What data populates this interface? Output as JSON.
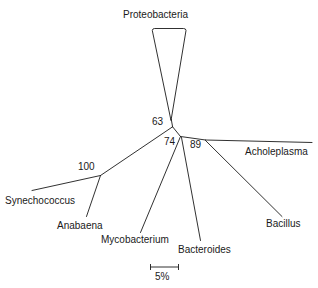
{
  "figure": {
    "type": "unrooted-phylogenetic-tree",
    "background_color": "#ffffff",
    "line_color": "#1a1a1a"
  },
  "taxa": [
    {
      "name": "Proteobacteria",
      "label": "Proteobacteria",
      "collapsed_clade": true
    },
    {
      "name": "Synechococcus",
      "label": "Synechococcus",
      "collapsed_clade": false
    },
    {
      "name": "Anabaena",
      "label": "Anabaena",
      "collapsed_clade": false
    },
    {
      "name": "Mycobacterium",
      "label": "Mycobacterium",
      "collapsed_clade": false
    },
    {
      "name": "Bacteroides",
      "label": "Bacteroides",
      "collapsed_clade": false
    },
    {
      "name": "Acholeplasma",
      "label": "Acholeplasma",
      "collapsed_clade": false
    },
    {
      "name": "Bacillus",
      "label": "Bacillus",
      "collapsed_clade": false
    }
  ],
  "support_values": [
    {
      "node": "node-63",
      "label": "63"
    },
    {
      "node": "node-100",
      "label": "100"
    },
    {
      "node": "node-74",
      "label": "74"
    },
    {
      "node": "node-89",
      "label": "89"
    }
  ],
  "scale_bar": {
    "label": "5%",
    "value": 5,
    "unit": "%"
  }
}
